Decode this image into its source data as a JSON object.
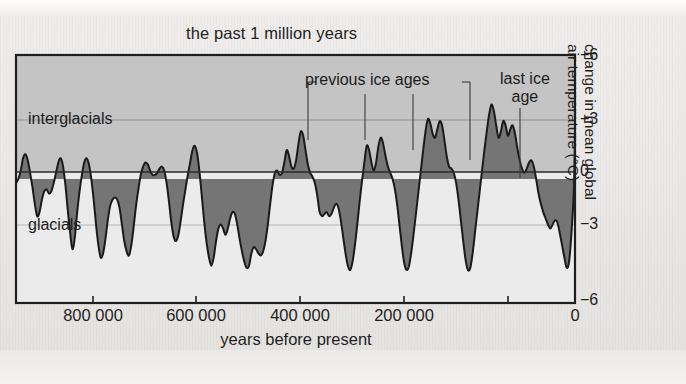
{
  "chart_data": {
    "type": "area",
    "title": "the past 1 million years",
    "xlabel": "years before present",
    "ylabel": "change in mean global air temperature (°C)",
    "ylabel_line1": "change in mean global",
    "ylabel_line2": "air temperature (°C)",
    "xlim": [
      950000,
      0
    ],
    "ylim": [
      -6,
      6
    ],
    "grid": true,
    "grid_levels": [
      3,
      0,
      -3
    ],
    "legend": "none",
    "x_ticks": [
      800000,
      600000,
      400000,
      200000,
      0
    ],
    "x_tick_labels": [
      "800 000",
      "600 000",
      "400 000",
      "200 000",
      "0"
    ],
    "y_ticks": [
      6,
      3,
      0,
      -3,
      -6
    ],
    "y_tick_labels": [
      "+6",
      "+3",
      "0",
      "−3",
      "−6"
    ],
    "annotations": [
      {
        "name": "interglacials",
        "text": "interglacials",
        "x": 905000,
        "y": 3.2
      },
      {
        "name": "glacials",
        "text": "glacials",
        "x": 905000,
        "y": -2.9
      },
      {
        "name": "previous-ice-ages",
        "text": "previous ice ages",
        "x": 470000,
        "y": 5.2,
        "leader_x": [
          470000,
          395000,
          320000,
          235000
        ]
      },
      {
        "name": "last-ice-age",
        "text_line1": "last ice",
        "text_line2": "age",
        "x": 110000,
        "y": 5.3,
        "leader_x": [
          105000
        ]
      }
    ],
    "series_name": "temperature anomaly",
    "x": [
      950000,
      946000,
      942000,
      938000,
      934000,
      930000,
      926000,
      922000,
      918000,
      914000,
      910000,
      906000,
      902000,
      898000,
      894000,
      890000,
      886000,
      882000,
      878000,
      874000,
      870000,
      866000,
      862000,
      858000,
      854000,
      850000,
      846000,
      842000,
      838000,
      834000,
      830000,
      826000,
      822000,
      818000,
      814000,
      810000,
      806000,
      802000,
      798000,
      794000,
      790000,
      786000,
      782000,
      778000,
      774000,
      770000,
      766000,
      762000,
      758000,
      754000,
      750000,
      746000,
      742000,
      738000,
      734000,
      730000,
      726000,
      722000,
      718000,
      714000,
      710000,
      706000,
      702000,
      698000,
      694000,
      690000,
      686000,
      682000,
      678000,
      674000,
      670000,
      666000,
      662000,
      658000,
      654000,
      650000,
      646000,
      642000,
      638000,
      634000,
      630000,
      626000,
      622000,
      618000,
      614000,
      610000,
      606000,
      602000,
      598000,
      594000,
      590000,
      586000,
      582000,
      578000,
      574000,
      570000,
      566000,
      562000,
      558000,
      554000,
      550000,
      546000,
      542000,
      538000,
      534000,
      530000,
      526000,
      522000,
      518000,
      514000,
      510000,
      506000,
      502000,
      498000,
      494000,
      490000,
      486000,
      482000,
      478000,
      474000,
      470000,
      466000,
      462000,
      458000,
      454000,
      450000,
      446000,
      442000,
      438000,
      434000,
      430000,
      426000,
      422000,
      418000,
      414000,
      410000,
      406000,
      402000,
      398000,
      394000,
      390000,
      386000,
      382000,
      378000,
      374000,
      370000,
      366000,
      362000,
      358000,
      354000,
      350000,
      346000,
      342000,
      338000,
      334000,
      330000,
      326000,
      322000,
      318000,
      314000,
      310000,
      306000,
      302000,
      298000,
      294000,
      290000,
      286000,
      282000,
      278000,
      274000,
      270000,
      266000,
      262000,
      258000,
      254000,
      250000,
      246000,
      242000,
      238000,
      234000,
      230000,
      226000,
      222000,
      218000,
      214000,
      210000,
      206000,
      202000,
      198000,
      194000,
      190000,
      186000,
      182000,
      178000,
      174000,
      170000,
      166000,
      162000,
      158000,
      154000,
      150000,
      146000,
      142000,
      138000,
      134000,
      130000,
      126000,
      122000,
      118000,
      114000,
      110000,
      106000,
      102000,
      98000,
      94000,
      90000,
      86000,
      82000,
      78000,
      74000,
      70000,
      66000,
      62000,
      58000,
      54000,
      50000,
      46000,
      42000,
      38000,
      34000,
      30000,
      26000,
      22000,
      18000,
      14000,
      10000,
      6000,
      2000,
      0
    ],
    "values": [
      -0.2,
      0.0,
      0.4,
      1.0,
      1.2,
      0.9,
      0.3,
      -0.4,
      -1.2,
      -1.8,
      -1.6,
      -1.0,
      -0.6,
      -0.5,
      -0.7,
      -0.6,
      -0.2,
      0.3,
      0.8,
      1.0,
      0.6,
      -0.3,
      -1.5,
      -2.6,
      -3.4,
      -2.8,
      -1.6,
      -0.6,
      0.2,
      0.8,
      1.0,
      0.7,
      0.0,
      -1.0,
      -2.2,
      -3.2,
      -3.8,
      -3.6,
      -2.9,
      -2.0,
      -1.3,
      -1.0,
      -0.9,
      -1.0,
      -1.4,
      -2.2,
      -3.0,
      -3.5,
      -3.7,
      -3.2,
      -2.3,
      -1.3,
      -0.5,
      0.2,
      0.6,
      0.8,
      0.7,
      0.4,
      0.2,
      0.2,
      0.3,
      0.5,
      0.6,
      0.4,
      -0.2,
      -1.1,
      -2.1,
      -2.8,
      -3.0,
      -2.7,
      -2.0,
      -1.2,
      -0.5,
      0.2,
      0.8,
      1.4,
      1.6,
      1.2,
      0.3,
      -0.9,
      -2.1,
      -3.1,
      -3.8,
      -4.2,
      -3.8,
      -3.0,
      -2.4,
      -2.2,
      -2.4,
      -2.7,
      -2.4,
      -1.9,
      -1.6,
      -1.7,
      -2.2,
      -2.9,
      -3.5,
      -4.0,
      -4.3,
      -4.2,
      -3.6,
      -3.3,
      -3.4,
      -3.6,
      -3.7,
      -3.5,
      -3.0,
      -2.2,
      -1.2,
      -0.3,
      0.3,
      0.4,
      0.2,
      0.3,
      0.8,
      1.4,
      1.1,
      0.6,
      0.5,
      0.9,
      1.7,
      2.3,
      2.1,
      1.4,
      0.7,
      0.3,
      0.1,
      -0.2,
      -0.8,
      -1.6,
      -1.8,
      -1.7,
      -1.6,
      -1.8,
      -1.7,
      -1.4,
      -1.2,
      -1.4,
      -2.0,
      -2.8,
      -3.6,
      -4.2,
      -4.4,
      -4.0,
      -3.2,
      -2.2,
      -1.1,
      -0.1,
      0.8,
      1.6,
      1.4,
      0.8,
      0.4,
      0.8,
      1.6,
      2.0,
      1.7,
      1.1,
      0.6,
      0.3,
      0.0,
      -0.5,
      -1.3,
      -2.3,
      -3.3,
      -4.1,
      -4.4,
      -4.2,
      -3.5,
      -2.6,
      -1.6,
      -0.6,
      0.4,
      1.4,
      2.3,
      2.9,
      2.7,
      2.2,
      2.0,
      2.4,
      2.8,
      2.6,
      1.9,
      1.1,
      0.6,
      0.5,
      0.3,
      -0.2,
      -1.0,
      -2.0,
      -3.0,
      -3.9,
      -4.4,
      -4.3,
      -3.6,
      -2.6,
      -1.6,
      -0.6,
      0.4,
      1.4,
      2.3,
      3.1,
      3.6,
      3.3,
      2.6,
      2.0,
      2.3,
      2.8,
      2.6,
      2.1,
      2.4,
      2.6,
      2.2,
      1.5,
      0.9,
      0.5,
      0.3,
      0.5,
      0.8,
      0.9,
      0.6,
      0.0,
      -0.7,
      -1.2,
      -1.6,
      -1.9,
      -2.2,
      -2.4,
      -2.2,
      -2.0,
      -2.1,
      -2.6,
      -3.2,
      -3.8,
      -4.3,
      -4.0,
      -2.6,
      -0.6,
      2.2
    ],
    "bands": [
      {
        "name": "interglacials-band",
        "range": [
          0,
          6
        ],
        "color": "#c4c4c4"
      },
      {
        "name": "glacials-band",
        "range": [
          -6,
          0
        ],
        "color": "#ebebeb"
      }
    ],
    "area_fill_color": "#757575",
    "line_color": "#1a1a1a",
    "frame_color": "#1f1f1f"
  }
}
